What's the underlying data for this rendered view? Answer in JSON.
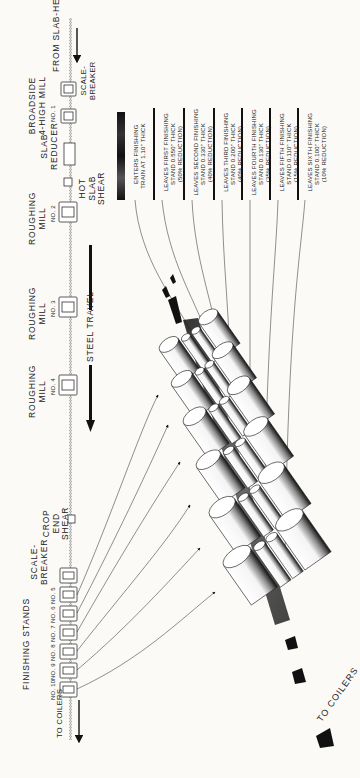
{
  "diagram": {
    "orientation": "rotated 90 degrees counter-clockwise",
    "mill_line": {
      "source": "FROM SLAB-HEATING FURNACES",
      "sink": "TO COILERS",
      "direction_label": "STEEL TRAVEL"
    },
    "stations": [
      {
        "id": "scale-breaker-1",
        "label": "SCALE-\nBREAKER"
      },
      {
        "id": "broadside-mill",
        "label": "BROADSIDE\n4-HIGH MILL",
        "sub": "NO. 1"
      },
      {
        "id": "slab-reducer",
        "label": "SLAB\nREDUCER"
      },
      {
        "id": "hot-slab-shear",
        "label": "HOT\nSLAB\nSHEAR"
      },
      {
        "id": "roughing-mill-2",
        "label": "ROUGHING\nMILL",
        "sub": "NO. 2"
      },
      {
        "id": "roughing-mill-3",
        "label": "ROUGHING\nMILL",
        "sub": "NO. 3"
      },
      {
        "id": "roughing-mill-4",
        "label": "ROUGHING\nMILL",
        "sub": "NO. 4"
      },
      {
        "id": "crop-end-shear",
        "label": "CROP\nEND\nSHEAR"
      },
      {
        "id": "scale-breaker-2",
        "label": "SCALE-\nBREAKER"
      }
    ],
    "finishing": {
      "group_label": "FINISHING STANDS",
      "stands": [
        "NO. 5",
        "NO. 6",
        "NO. 7",
        "NO. 8",
        "NO. 9",
        "NO. 10"
      ]
    },
    "annotations": [
      {
        "id": "enter",
        "text": "ENTERS FINISHING\nTRAIN AT 1.10\" THICK"
      },
      {
        "id": "stand1",
        "text": "LEAVES FIRST FINISHING\nSTAND 0.550\" THICK\n(50% REDUCTION)"
      },
      {
        "id": "stand2",
        "text": "LEAVES SECOND FINISHING\nSTAND 0.330\" THICK\n(40% REDUCTION)"
      },
      {
        "id": "stand3",
        "text": "LEAVES THIRD FINISHING\nSTAND 0.200\" THICK\n(40% REDUCTION)"
      },
      {
        "id": "stand4",
        "text": "LEAVES FOURTH FINISHING\nSTAND 0.130\" THICK\n(35% REDUCTION)"
      },
      {
        "id": "stand5",
        "text": "LEAVES FIFTH FINISHING\nSTAND 0.110\" THICK\n(15% REDUCTION)"
      },
      {
        "id": "stand6",
        "text": "LEAVES SIXTH FINISHING\nSTAND 0.100\" THICK\n(10% REDUCTION)"
      }
    ],
    "thickness_sequence_in": [
      1.1,
      0.55,
      0.33,
      0.2,
      0.13,
      0.11,
      0.1
    ],
    "reduction_pct": [
      50,
      40,
      40,
      35,
      15,
      10
    ],
    "colors": {
      "ink": "#1a1a1a",
      "paper": "#fbfaf6",
      "strip": "#2a2a2a"
    }
  }
}
